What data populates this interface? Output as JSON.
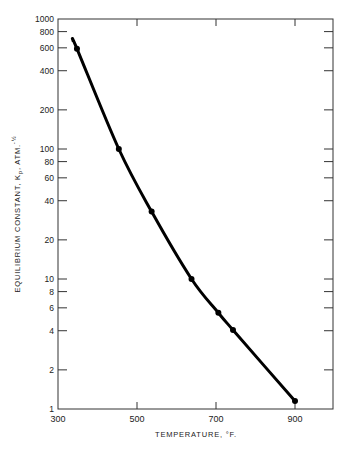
{
  "chart_data": {
    "type": "line",
    "title": "",
    "xlabel": "TEMPERATURE, °F.",
    "ylabel": "EQUILIBRIUM CONSTANT, Kp, ATM.^-½",
    "ylabel_main": "EQUILIBRIUM CONSTANT, K",
    "ylabel_sub": "p",
    "ylabel_tail": ", ATM.",
    "ylabel_exp": "-½",
    "xlim": [
      300,
      1000
    ],
    "ylim": [
      1,
      1000
    ],
    "yscale": "log",
    "grid": false,
    "legend": null,
    "x_ticks": [
      300,
      500,
      700,
      900
    ],
    "x_tick_labels": [
      "300",
      "500",
      "700",
      "900"
    ],
    "y_ticks": [
      1,
      2,
      4,
      6,
      8,
      10,
      20,
      40,
      60,
      80,
      100,
      200,
      400,
      600,
      800,
      1000
    ],
    "y_tick_labels": [
      "1",
      "2",
      "4",
      "6",
      "8",
      "10",
      "20",
      "40",
      "60",
      "80",
      "100",
      "200",
      "400",
      "600",
      "800",
      "1000"
    ],
    "series": [
      {
        "name": "Kp",
        "markers": true,
        "x": [
          348,
          454,
          537,
          638,
          706,
          743,
          900
        ],
        "y": [
          590,
          100,
          33,
          10,
          5.5,
          4.05,
          1.15
        ]
      }
    ],
    "curve_start": {
      "x": 338,
      "y": 680
    }
  }
}
